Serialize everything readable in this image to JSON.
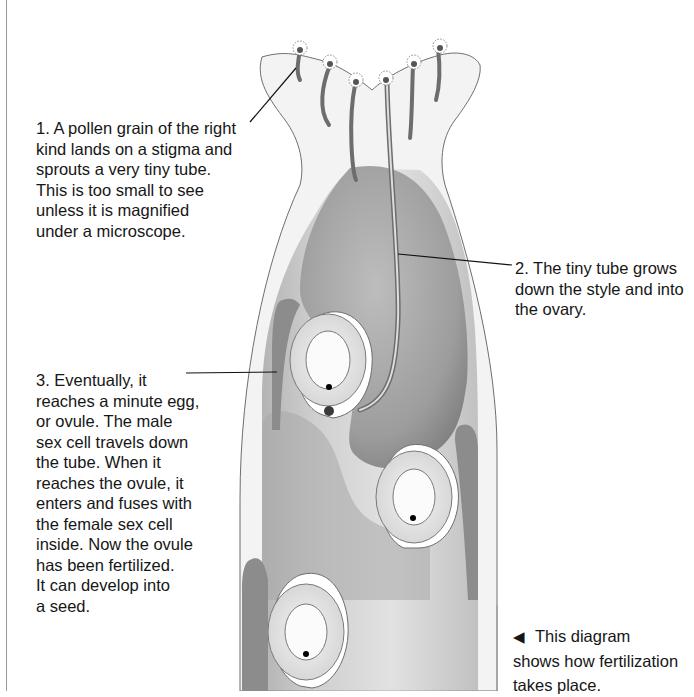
{
  "diagram": {
    "labels": [
      {
        "id": "step1",
        "text": "1.  A pollen grain of the right\nkind lands on a stigma and\nsprouts a very tiny tube.\nThis is too small to see\nunless it is magnified\nunder a microscope."
      },
      {
        "id": "step2",
        "text": "2.  The tiny tube grows\ndown the style and into\nthe ovary."
      },
      {
        "id": "step3",
        "text": "3.  Eventually, it\nreaches a minute egg,\nor ovule. The male\nsex cell travels down\nthe tube. When it\nreaches the ovule, it\nenters and fuses with\nthe female sex cell\ninside. Now the ovule\nhas been fertilized.\nIt can develop into\na seed."
      }
    ],
    "caption": {
      "pointer_icon": "◀",
      "text": "This diagram\nshows how fertilization\ntakes place."
    },
    "colors": {
      "outline": "#6e6e6e",
      "ovary_fill": "#9c9c9c",
      "style_fill": "#f1f1f1",
      "ovule_ring": "#d8d8d8",
      "leader_line": "#111111"
    }
  }
}
